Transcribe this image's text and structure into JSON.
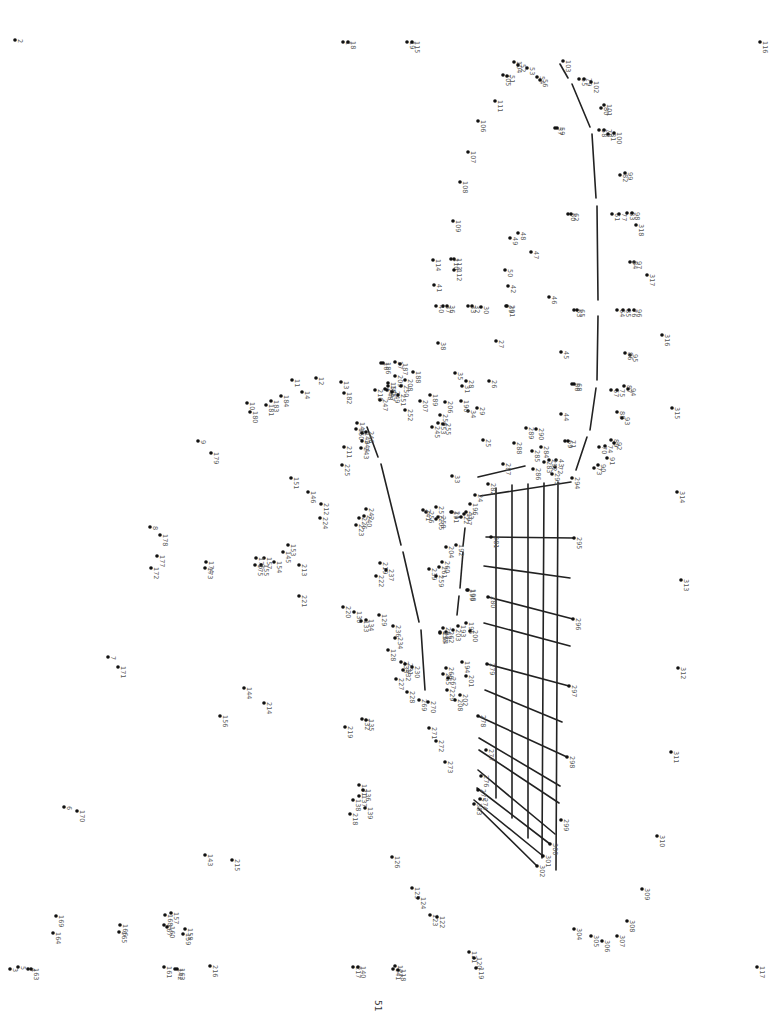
{
  "page": {
    "page_number": "51",
    "orientation": "rotated-90"
  },
  "dots": [
    [
      "1",
      343,
      42
    ],
    [
      "18",
      348,
      42
    ],
    [
      "19",
      407,
      42
    ],
    [
      "115",
      412,
      42
    ],
    [
      "2",
      15,
      40
    ],
    [
      "116",
      760,
      42
    ],
    [
      "104",
      514,
      62
    ],
    [
      "52",
      518,
      65
    ],
    [
      "53",
      527,
      68
    ],
    [
      "54",
      537,
      77
    ],
    [
      "56",
      540,
      80
    ],
    [
      "105",
      503,
      75
    ],
    [
      "51",
      507,
      76
    ],
    [
      "103",
      563,
      61
    ],
    [
      "55",
      579,
      79
    ],
    [
      "79",
      584,
      79
    ],
    [
      "102",
      591,
      82
    ],
    [
      "111",
      495,
      101
    ],
    [
      "101",
      604,
      105
    ],
    [
      "80",
      601,
      108
    ],
    [
      "58",
      599,
      130
    ],
    [
      "78",
      604,
      130
    ],
    [
      "81",
      608,
      134
    ],
    [
      "100",
      614,
      133
    ],
    [
      "57",
      555,
      128
    ],
    [
      "59",
      557,
      128
    ],
    [
      "106",
      478,
      121
    ],
    [
      "107",
      468,
      152
    ],
    [
      "108",
      460,
      182
    ],
    [
      "99",
      625,
      173
    ],
    [
      "82",
      620,
      175
    ],
    [
      "60",
      568,
      214
    ],
    [
      "62",
      571,
      214
    ],
    [
      "61",
      612,
      214
    ],
    [
      "77",
      619,
      214
    ],
    [
      "83",
      627,
      213
    ],
    [
      "98",
      632,
      213
    ],
    [
      "318",
      636,
      225
    ],
    [
      "48",
      518,
      233
    ],
    [
      "49",
      510,
      238
    ],
    [
      "47",
      531,
      252
    ],
    [
      "109",
      453,
      221
    ],
    [
      "110",
      451,
      259
    ],
    [
      "113",
      454,
      259
    ],
    [
      "114",
      433,
      260
    ],
    [
      "112",
      454,
      270
    ],
    [
      "97",
      634,
      262
    ],
    [
      "84",
      630,
      262
    ],
    [
      "317",
      647,
      275
    ],
    [
      "50",
      505,
      270
    ],
    [
      "42",
      508,
      286
    ],
    [
      "39",
      506,
      306
    ],
    [
      "291",
      507,
      306
    ],
    [
      "46",
      549,
      297
    ],
    [
      "63",
      574,
      310
    ],
    [
      "65",
      577,
      310
    ],
    [
      "64",
      617,
      310
    ],
    [
      "85",
      623,
      310
    ],
    [
      "76",
      629,
      310
    ],
    [
      "96",
      634,
      310
    ],
    [
      "41",
      434,
      285
    ],
    [
      "40",
      436,
      306
    ],
    [
      "37",
      443,
      306
    ],
    [
      "36",
      447,
      306
    ],
    [
      "33",
      468,
      306
    ],
    [
      "32",
      472,
      306
    ],
    [
      "30",
      481,
      307
    ],
    [
      "316",
      662,
      335
    ],
    [
      "27",
      496,
      341
    ],
    [
      "38",
      438,
      343
    ],
    [
      "95",
      630,
      355
    ],
    [
      "86",
      625,
      353
    ],
    [
      "45",
      561,
      352
    ],
    [
      "87",
      624,
      386
    ],
    [
      "94",
      628,
      389
    ],
    [
      "67",
      611,
      390
    ],
    [
      "75",
      617,
      390
    ],
    [
      "315",
      672,
      408
    ],
    [
      "88",
      617,
      412
    ],
    [
      "93",
      622,
      418
    ],
    [
      "66",
      572,
      384
    ],
    [
      "68",
      574,
      384
    ],
    [
      "44",
      561,
      414
    ],
    [
      "89",
      611,
      440
    ],
    [
      "92",
      614,
      443
    ],
    [
      "74",
      605,
      446
    ],
    [
      "70",
      599,
      447
    ],
    [
      "69",
      565,
      441
    ],
    [
      "71",
      568,
      441
    ],
    [
      "91",
      607,
      458
    ],
    [
      "90",
      598,
      465
    ],
    [
      "73",
      594,
      468
    ],
    [
      "294",
      572,
      478
    ],
    [
      "293",
      552,
      474
    ],
    [
      "72",
      555,
      467
    ],
    [
      "43",
      556,
      460
    ],
    [
      "292",
      549,
      460
    ],
    [
      "289",
      526,
      428
    ],
    [
      "290",
      536,
      429
    ],
    [
      "284",
      541,
      447
    ],
    [
      "286",
      533,
      469
    ],
    [
      "283",
      544,
      462
    ],
    [
      "285",
      532,
      451
    ],
    [
      "288",
      514,
      443
    ],
    [
      "287",
      503,
      464
    ],
    [
      "282",
      488,
      484
    ],
    [
      "25",
      483,
      440
    ],
    [
      "26",
      489,
      381
    ],
    [
      "28",
      466,
      381
    ],
    [
      "314",
      677,
      492
    ],
    [
      "313",
      681,
      580
    ],
    [
      "312",
      678,
      668
    ],
    [
      "311",
      671,
      752
    ],
    [
      "310",
      657,
      836
    ],
    [
      "309",
      642,
      889
    ],
    [
      "308",
      627,
      921
    ],
    [
      "307",
      617,
      936
    ],
    [
      "306",
      602,
      941
    ],
    [
      "305",
      591,
      936
    ],
    [
      "304",
      574,
      929
    ],
    [
      "117",
      757,
      967
    ],
    [
      "16",
      381,
      363
    ],
    [
      "186",
      383,
      363
    ],
    [
      "17",
      395,
      362
    ],
    [
      "187",
      400,
      364
    ],
    [
      "188",
      413,
      372
    ],
    [
      "209",
      395,
      376
    ],
    [
      "208",
      405,
      380
    ],
    [
      "250",
      401,
      386
    ],
    [
      "207",
      420,
      401
    ],
    [
      "189",
      430,
      395
    ],
    [
      "15",
      388,
      383
    ],
    [
      "185",
      388,
      386
    ],
    [
      "147",
      387,
      390
    ],
    [
      "210",
      375,
      390
    ],
    [
      "247",
      380,
      400
    ],
    [
      "248",
      385,
      389
    ],
    [
      "249",
      392,
      392
    ],
    [
      "251",
      398,
      395
    ],
    [
      "13",
      341,
      382
    ],
    [
      "182",
      344,
      393
    ],
    [
      "12",
      316,
      378
    ],
    [
      "11",
      292,
      380
    ],
    [
      "14",
      302,
      392
    ],
    [
      "184",
      281,
      396
    ],
    [
      "183",
      271,
      401
    ],
    [
      "181",
      266,
      405
    ],
    [
      "10",
      247,
      403
    ],
    [
      "180",
      250,
      412
    ],
    [
      "35",
      455,
      373
    ],
    [
      "31",
      462,
      386
    ],
    [
      "34",
      468,
      411
    ],
    [
      "29",
      477,
      408
    ],
    [
      "190",
      461,
      401
    ],
    [
      "206",
      445,
      402
    ],
    [
      "254",
      440,
      415
    ],
    [
      "253",
      438,
      423
    ],
    [
      "245",
      432,
      427
    ],
    [
      "255",
      443,
      424
    ],
    [
      "252",
      405,
      410
    ],
    [
      "148",
      357,
      423
    ],
    [
      "150",
      356,
      429
    ],
    [
      "149",
      362,
      433
    ],
    [
      "246",
      366,
      432
    ],
    [
      "244",
      362,
      441
    ],
    [
      "243",
      361,
      448
    ],
    [
      "211",
      344,
      447
    ],
    [
      "225",
      342,
      465
    ],
    [
      "9",
      198,
      441
    ],
    [
      "179",
      211,
      453
    ],
    [
      "151",
      291,
      478
    ],
    [
      "146",
      308,
      492
    ],
    [
      "212",
      321,
      504
    ],
    [
      "224",
      320,
      518
    ],
    [
      "242",
      366,
      509
    ],
    [
      "240",
      364,
      516
    ],
    [
      "226",
      359,
      518
    ],
    [
      "223",
      356,
      525
    ],
    [
      "33b",
      452,
      476
    ],
    [
      "24",
      475,
      495
    ],
    [
      "191",
      451,
      512
    ],
    [
      "21",
      452,
      512
    ],
    [
      "197",
      464,
      514
    ],
    [
      "22",
      461,
      517
    ],
    [
      "23",
      466,
      512
    ],
    [
      "196",
      470,
      504
    ],
    [
      "256",
      426,
      512
    ],
    [
      "257",
      436,
      507
    ],
    [
      "241",
      423,
      510
    ],
    [
      "205",
      436,
      519
    ],
    [
      "258",
      438,
      517
    ],
    [
      "281",
      491,
      537
    ],
    [
      "295",
      574,
      538
    ],
    [
      "192",
      456,
      545
    ],
    [
      "204",
      446,
      547
    ],
    [
      "260",
      442,
      562
    ],
    [
      "261",
      439,
      567
    ],
    [
      "239",
      429,
      569
    ],
    [
      "259",
      436,
      576
    ],
    [
      "8",
      150,
      527
    ],
    [
      "178",
      160,
      535
    ],
    [
      "177",
      157,
      556
    ],
    [
      "172",
      151,
      568
    ],
    [
      "174",
      206,
      562
    ],
    [
      "173",
      205,
      568
    ],
    [
      "153",
      288,
      545
    ],
    [
      "145",
      283,
      552
    ],
    [
      "157",
      264,
      558
    ],
    [
      "176",
      256,
      558
    ],
    [
      "155",
      261,
      565
    ],
    [
      "175",
      255,
      565
    ],
    [
      "154",
      274,
      562
    ],
    [
      "213",
      299,
      565
    ],
    [
      "221",
      299,
      596
    ],
    [
      "219",
      380,
      563
    ],
    [
      "237",
      386,
      570
    ],
    [
      "222",
      376,
      576
    ],
    [
      "220",
      343,
      607
    ],
    [
      "130",
      354,
      612
    ],
    [
      "129",
      379,
      615
    ],
    [
      "134",
      366,
      620
    ],
    [
      "133",
      361,
      621
    ],
    [
      "198",
      468,
      590
    ],
    [
      "199",
      467,
      590
    ],
    [
      "280",
      488,
      597
    ],
    [
      "296",
      573,
      619
    ],
    [
      "195",
      466,
      623
    ],
    [
      "193",
      458,
      626
    ],
    [
      "203",
      453,
      630
    ],
    [
      "200",
      470,
      631
    ],
    [
      "262",
      446,
      632
    ],
    [
      "263",
      443,
      628
    ],
    [
      "264",
      440,
      633
    ],
    [
      "235",
      440,
      632
    ],
    [
      "236",
      393,
      626
    ],
    [
      "234",
      395,
      638
    ],
    [
      "128",
      388,
      650
    ],
    [
      "233",
      401,
      662
    ],
    [
      "231",
      405,
      664
    ],
    [
      "230",
      412,
      667
    ],
    [
      "232",
      403,
      670
    ],
    [
      "227",
      396,
      679
    ],
    [
      "228",
      407,
      692
    ],
    [
      "194",
      462,
      662
    ],
    [
      "201",
      466,
      676
    ],
    [
      "266",
      446,
      668
    ],
    [
      "265",
      443,
      674
    ],
    [
      "267",
      448,
      678
    ],
    [
      "229",
      447,
      690
    ],
    [
      "202",
      460,
      695
    ],
    [
      "208b",
      455,
      700
    ],
    [
      "279",
      487,
      664
    ],
    [
      "297",
      569,
      686
    ],
    [
      "7",
      108,
      657
    ],
    [
      "171",
      118,
      667
    ],
    [
      "144",
      244,
      688
    ],
    [
      "214",
      264,
      703
    ],
    [
      "156",
      220,
      716
    ],
    [
      "269",
      419,
      700
    ],
    [
      "270",
      428,
      702
    ],
    [
      "271",
      429,
      728
    ],
    [
      "272",
      436,
      741
    ],
    [
      "273",
      445,
      762
    ],
    [
      "132",
      362,
      719
    ],
    [
      "135",
      366,
      720
    ],
    [
      "219b",
      345,
      727
    ],
    [
      "278",
      478,
      716
    ],
    [
      "298",
      567,
      757
    ],
    [
      "277",
      486,
      750
    ],
    [
      "276",
      481,
      776
    ],
    [
      "275",
      478,
      790
    ],
    [
      "274",
      480,
      799
    ],
    [
      "303",
      474,
      804
    ],
    [
      "131",
      359,
      785
    ],
    [
      "136",
      363,
      790
    ],
    [
      "137",
      359,
      796
    ],
    [
      "138",
      353,
      800
    ],
    [
      "139",
      365,
      808
    ],
    [
      "218",
      350,
      814
    ],
    [
      "299",
      561,
      820
    ],
    [
      "300",
      550,
      844
    ],
    [
      "301",
      543,
      856
    ],
    [
      "302",
      537,
      866
    ],
    [
      "6",
      64,
      807
    ],
    [
      "170",
      77,
      811
    ],
    [
      "143",
      205,
      855
    ],
    [
      "215",
      232,
      860
    ],
    [
      "126",
      392,
      857
    ],
    [
      "125",
      412,
      888
    ],
    [
      "124",
      418,
      898
    ],
    [
      "123",
      430,
      915
    ],
    [
      "122",
      437,
      917
    ],
    [
      "169",
      56,
      916
    ],
    [
      "164",
      53,
      933
    ],
    [
      "166",
      120,
      925
    ],
    [
      "165",
      119,
      932
    ],
    [
      "157b",
      171,
      913
    ],
    [
      "168",
      165,
      915
    ],
    [
      "167",
      164,
      925
    ],
    [
      "160",
      167,
      927
    ],
    [
      "158",
      185,
      929
    ],
    [
      "159",
      183,
      934
    ],
    [
      "121",
      469,
      952
    ],
    [
      "120",
      474,
      958
    ],
    [
      "119",
      476,
      968
    ],
    [
      "3",
      10,
      969
    ],
    [
      "5",
      18,
      967
    ],
    [
      "4",
      28,
      969
    ],
    [
      "163",
      31,
      969
    ],
    [
      "161",
      164,
      967
    ],
    [
      "142",
      175,
      969
    ],
    [
      "162",
      177,
      969
    ],
    [
      "216",
      210,
      966
    ],
    [
      "217",
      353,
      967
    ],
    [
      "140",
      358,
      967
    ],
    [
      "127",
      395,
      966
    ],
    [
      "141",
      393,
      969
    ],
    [
      "118",
      398,
      970
    ]
  ],
  "segments": [
    [
      560,
      64,
      568,
      78
    ],
    [
      572,
      84,
      590,
      127
    ],
    [
      592,
      134,
      596,
      198
    ],
    [
      597,
      206,
      598,
      300
    ],
    [
      598,
      316,
      597,
      380
    ],
    [
      596,
      388,
      590,
      430
    ],
    [
      587,
      437,
      576,
      470
    ],
    [
      478,
      477,
      525,
      466
    ],
    [
      496,
      488,
      496,
      798
    ],
    [
      512,
      485,
      512,
      818
    ],
    [
      528,
      484,
      528,
      838
    ],
    [
      544,
      483,
      542,
      858
    ],
    [
      558,
      482,
      556,
      870
    ],
    [
      480,
      496,
      571,
      482
    ],
    [
      486,
      537,
      574,
      538
    ],
    [
      484,
      566,
      570,
      578
    ],
    [
      488,
      597,
      573,
      619
    ],
    [
      484,
      623,
      570,
      646
    ],
    [
      487,
      664,
      569,
      686
    ],
    [
      485,
      690,
      562,
      722
    ],
    [
      478,
      716,
      567,
      757
    ],
    [
      479,
      738,
      560,
      786
    ],
    [
      479,
      750,
      559,
      803
    ],
    [
      478,
      770,
      555,
      834
    ],
    [
      477,
      788,
      550,
      844
    ],
    [
      474,
      800,
      543,
      856
    ],
    [
      478,
      808,
      537,
      866
    ],
    [
      465,
      528,
      463,
      546
    ],
    [
      463,
      552,
      460,
      588
    ],
    [
      459,
      596,
      457,
      615
    ],
    [
      367,
      427,
      378,
      457
    ],
    [
      381,
      464,
      401,
      545
    ],
    [
      403,
      552,
      419,
      622
    ],
    [
      421,
      630,
      425,
      690
    ]
  ]
}
